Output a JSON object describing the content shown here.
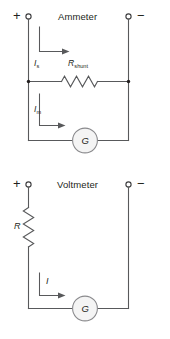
{
  "figure": {
    "type": "circuit-diagram",
    "background_color": "#ffffff",
    "wire_color": "#58595b",
    "text_color": "#231f20",
    "meter_fill_color": "#f4f4f4",
    "panels": [
      {
        "id": "ammeter",
        "title": "Ammeter",
        "terminals": [
          {
            "name": "positive-terminal",
            "sign": "+"
          },
          {
            "name": "negative-terminal",
            "sign": "−"
          }
        ],
        "components": [
          {
            "name": "shunt-resistor",
            "label": "R",
            "subscript": "shunt",
            "symbol": "zigzag-resistor"
          },
          {
            "name": "galvanometer",
            "label": "G",
            "symbol": "circle-meter"
          }
        ],
        "currents": [
          {
            "name": "shunt-current",
            "label": "I",
            "subscript": "s"
          },
          {
            "name": "meter-current",
            "label": "I",
            "subscript": "m"
          }
        ]
      },
      {
        "id": "voltmeter",
        "title": "Voltmeter",
        "terminals": [
          {
            "name": "positive-terminal",
            "sign": "+"
          },
          {
            "name": "negative-terminal",
            "sign": "−"
          }
        ],
        "components": [
          {
            "name": "series-resistor",
            "label": "R",
            "subscript": "",
            "symbol": "zigzag-resistor"
          },
          {
            "name": "galvanometer",
            "label": "G",
            "symbol": "circle-meter"
          }
        ],
        "currents": [
          {
            "name": "total-current",
            "label": "I",
            "subscript": ""
          }
        ]
      }
    ]
  }
}
